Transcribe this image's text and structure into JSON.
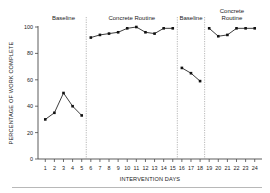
{
  "chart_data": {
    "type": "line",
    "title": "",
    "xlabel": "INTERVENTION DAYS",
    "ylabel": "PERCENTAGE OF WORK COMPLETE",
    "xlim": [
      0.2,
      24.8
    ],
    "ylim": [
      0,
      100
    ],
    "grid": false,
    "legend_position": "none",
    "ytick_labels": [
      "0",
      "20",
      "40",
      "60",
      "80",
      "100"
    ],
    "ytick_values": [
      0,
      20,
      40,
      60,
      80,
      100
    ],
    "xtick_labels": [
      "1",
      "2",
      "3",
      "4",
      "5",
      "6",
      "7",
      "8",
      "9",
      "10",
      "11",
      "12",
      "13",
      "14",
      "15",
      "16",
      "17",
      "18",
      "19",
      "20",
      "21",
      "22",
      "23",
      "24"
    ],
    "xtick_values": [
      1,
      2,
      3,
      4,
      5,
      6,
      7,
      8,
      9,
      10,
      11,
      12,
      13,
      14,
      15,
      16,
      17,
      18,
      19,
      20,
      21,
      22,
      23,
      24
    ],
    "marker": "square",
    "line_color": "#111111",
    "phase_dividers": [
      5.5,
      15.5,
      18.5
    ],
    "phases": [
      {
        "label": "Baseline",
        "label_lines": [
          "Baseline"
        ],
        "x": [
          1,
          2,
          3,
          4,
          5
        ],
        "values": [
          30,
          35,
          50,
          40,
          33
        ]
      },
      {
        "label": "Concrete Routine",
        "label_lines": [
          "Concrete Routine"
        ],
        "x": [
          6,
          7,
          8,
          9,
          10,
          11,
          12,
          13,
          14,
          15
        ],
        "values": [
          92,
          94,
          95,
          96,
          99,
          100,
          96,
          95,
          99,
          99
        ]
      },
      {
        "label": "Baseline",
        "label_lines": [
          "Baseline"
        ],
        "x": [
          16,
          17,
          18
        ],
        "values": [
          69,
          65,
          59
        ]
      },
      {
        "label": "Concrete Routine",
        "label_lines": [
          "Concrete",
          "Routine"
        ],
        "x": [
          19,
          20,
          21,
          22,
          23,
          24
        ],
        "values": [
          99,
          93,
          94,
          99,
          99,
          99
        ]
      }
    ]
  }
}
